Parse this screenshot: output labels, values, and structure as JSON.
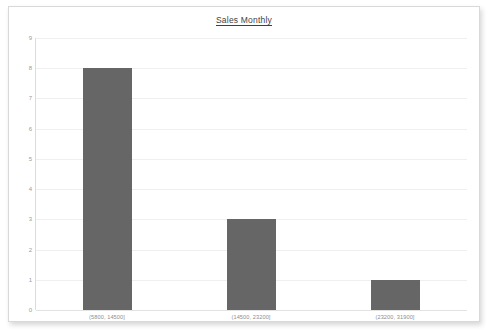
{
  "chart_data": {
    "type": "bar",
    "title": "Sales Monthly",
    "xlabel": "",
    "ylabel": "",
    "categories": [
      "(5800, 14500]",
      "(14500, 23200]",
      "(23200, 31900]"
    ],
    "values": [
      8,
      3,
      1
    ],
    "ylim": [
      0,
      9
    ],
    "ytick_labels": [
      "0",
      "1",
      "2",
      "3",
      "4",
      "5",
      "6",
      "7",
      "8",
      "9"
    ],
    "ytick_values": [
      0,
      1,
      2,
      3,
      4,
      5,
      6,
      7,
      8,
      9
    ],
    "grid": true,
    "legend": false,
    "bar_color": "#666666",
    "gridline_color": "#efefef",
    "axis_color": "#dcdcdc",
    "title_color": "#3f3f3f",
    "tick_label_color": "#9b9b9b"
  },
  "frame": {
    "background_color": "#ffffff",
    "border_color": "#d9d9d9"
  }
}
